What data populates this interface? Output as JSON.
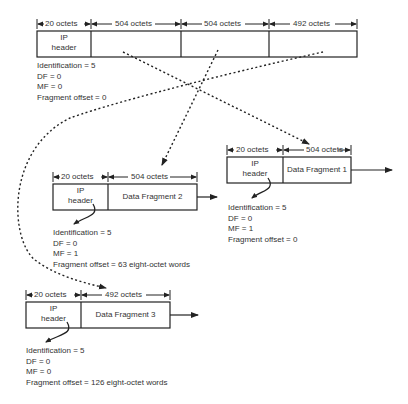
{
  "original": {
    "widths": [
      "20 octets",
      "504 octets",
      "504 octets",
      "492 octets"
    ],
    "header_label_line1": "IP",
    "header_label_line2": "header",
    "fields": [
      "Identification = 5",
      "DF = 0",
      "MF = 0",
      "Fragment offset = 0"
    ]
  },
  "fragment1": {
    "widths": [
      "20 octets",
      "504 octets"
    ],
    "header_label_line1": "IP",
    "header_label_line2": "header",
    "data_label": "Data Fragment 1",
    "fields": [
      "Identification = 5",
      "DF = 0",
      "MF = 1",
      "Fragment offset = 0"
    ]
  },
  "fragment2": {
    "widths": [
      "20 octets",
      "504 octets"
    ],
    "header_label_line1": "IP",
    "header_label_line2": "header",
    "data_label": "Data Fragment 2",
    "fields": [
      "Identification = 5",
      "DF = 0",
      "MF = 1",
      "Fragment offset = 63 eight-octet words"
    ]
  },
  "fragment3": {
    "widths": [
      "20 octets",
      "492 octets"
    ],
    "header_label_line1": "IP",
    "header_label_line2": "header",
    "data_label": "Data Fragment 3",
    "fields": [
      "Identification = 5",
      "DF = 0",
      "MF = 0",
      "Fragment offset = 126 eight-octet words"
    ]
  }
}
